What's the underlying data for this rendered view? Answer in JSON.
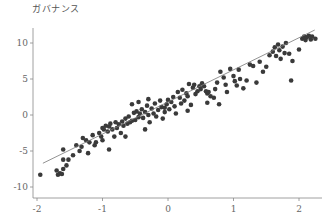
{
  "chart_data": {
    "type": "scatter",
    "title": "",
    "xlabel": "",
    "ylabel": "ガバナンス",
    "xlim": [
      -2.05,
      2.35
    ],
    "ylim": [
      -11,
      12.5
    ],
    "xticks": [
      -2,
      -1,
      0,
      1,
      2
    ],
    "yticks": [
      -10,
      -5,
      0,
      5,
      10
    ],
    "grid": false,
    "legend": null,
    "regression_line": {
      "x0": -1.91,
      "y0": -6.7,
      "x1": 2.24,
      "y1": 11.8
    },
    "points": [
      [
        -1.95,
        -8.3
      ],
      [
        -1.7,
        -7.7
      ],
      [
        -1.68,
        -8.3
      ],
      [
        -1.65,
        -8.1
      ],
      [
        -1.62,
        -8.2
      ],
      [
        -1.6,
        -7.5
      ],
      [
        -1.55,
        -7.0
      ],
      [
        -1.52,
        -6.2
      ],
      [
        -1.6,
        -4.8
      ],
      [
        -1.6,
        -6.2
      ],
      [
        -1.45,
        -5.6
      ],
      [
        -1.4,
        -4.2
      ],
      [
        -1.35,
        -5.0
      ],
      [
        -1.32,
        -4.4
      ],
      [
        -1.25,
        -3.5
      ],
      [
        -1.22,
        -5.3
      ],
      [
        -1.2,
        -3.8
      ],
      [
        -1.15,
        -2.8
      ],
      [
        -1.12,
        -4.2
      ],
      [
        -1.1,
        -3.8
      ],
      [
        -1.05,
        -2.5
      ],
      [
        -1.0,
        -1.8
      ],
      [
        -0.98,
        -2.0
      ],
      [
        -0.95,
        -1.5
      ],
      [
        -0.92,
        -2.3
      ],
      [
        -0.9,
        -1.6
      ],
      [
        -0.88,
        -1.2
      ],
      [
        -0.85,
        -2.0
      ],
      [
        -0.82,
        -3.0
      ],
      [
        -0.8,
        -1.0
      ],
      [
        -0.78,
        -1.8
      ],
      [
        -0.75,
        -1.3
      ],
      [
        -0.72,
        -2.5
      ],
      [
        -0.7,
        -0.9
      ],
      [
        -0.68,
        -1.5
      ],
      [
        -0.65,
        -0.5
      ],
      [
        -0.62,
        -1.2
      ],
      [
        -0.6,
        -0.2
      ],
      [
        -0.58,
        -1.0
      ],
      [
        -0.55,
        -0.8
      ],
      [
        -0.52,
        0.3
      ],
      [
        -0.5,
        -0.7
      ],
      [
        -0.48,
        0.5
      ],
      [
        -0.45,
        -0.3
      ],
      [
        -0.43,
        0.2
      ],
      [
        -0.4,
        0.8
      ],
      [
        -0.38,
        -0.4
      ],
      [
        -0.35,
        0.4
      ],
      [
        -0.32,
        1.3
      ],
      [
        -0.3,
        0.0
      ],
      [
        -0.28,
        -1.0
      ],
      [
        -0.25,
        0.9
      ],
      [
        -0.22,
        0.2
      ],
      [
        -0.2,
        1.6
      ],
      [
        -0.18,
        -0.2
      ],
      [
        -0.15,
        0.7
      ],
      [
        -0.12,
        2.0
      ],
      [
        -0.1,
        1.1
      ],
      [
        -0.08,
        -0.5
      ],
      [
        -0.05,
        0.4
      ],
      [
        -0.02,
        1.5
      ],
      [
        0.0,
        2.1
      ],
      [
        0.02,
        0.8
      ],
      [
        0.05,
        1.8
      ],
      [
        0.08,
        2.5
      ],
      [
        0.1,
        1.2
      ],
      [
        0.12,
        0.2
      ],
      [
        0.15,
        3.2
      ],
      [
        0.18,
        2.4
      ],
      [
        0.2,
        1.6
      ],
      [
        0.22,
        3.5
      ],
      [
        0.25,
        2.0
      ],
      [
        0.28,
        3.0
      ],
      [
        0.3,
        2.6
      ],
      [
        0.32,
        4.3
      ],
      [
        0.35,
        1.4
      ],
      [
        0.38,
        3.8
      ],
      [
        0.4,
        4.2
      ],
      [
        0.42,
        2.9
      ],
      [
        0.45,
        3.3
      ],
      [
        0.48,
        4.0
      ],
      [
        0.5,
        3.6
      ],
      [
        0.52,
        4.4
      ],
      [
        0.55,
        4.0
      ],
      [
        0.58,
        3.3
      ],
      [
        0.6,
        3.0
      ],
      [
        0.62,
        3.2
      ],
      [
        0.65,
        2.6
      ],
      [
        0.7,
        2.4
      ],
      [
        0.72,
        3.6
      ],
      [
        0.75,
        4.5
      ],
      [
        0.78,
        1.5
      ],
      [
        0.8,
        6.0
      ],
      [
        0.85,
        5.2
      ],
      [
        0.88,
        4.2
      ],
      [
        0.9,
        3.2
      ],
      [
        0.95,
        6.4
      ],
      [
        1.0,
        5.4
      ],
      [
        1.02,
        4.7
      ],
      [
        1.05,
        4.1
      ],
      [
        1.08,
        6.3
      ],
      [
        1.1,
        5.0
      ],
      [
        1.15,
        3.7
      ],
      [
        1.2,
        4.8
      ],
      [
        1.25,
        7.0
      ],
      [
        1.3,
        6.8
      ],
      [
        1.35,
        4.5
      ],
      [
        1.4,
        7.4
      ],
      [
        1.45,
        6.0
      ],
      [
        1.5,
        6.7
      ],
      [
        1.55,
        8.3
      ],
      [
        1.6,
        8.8
      ],
      [
        1.63,
        9.4
      ],
      [
        1.65,
        8.2
      ],
      [
        1.68,
        9.8
      ],
      [
        1.7,
        9.0
      ],
      [
        1.72,
        7.8
      ],
      [
        1.75,
        9.5
      ],
      [
        1.78,
        8.6
      ],
      [
        1.8,
        10.0
      ],
      [
        1.85,
        8.5
      ],
      [
        1.88,
        4.8
      ],
      [
        1.9,
        7.5
      ],
      [
        2.0,
        9.1
      ],
      [
        2.05,
        10.6
      ],
      [
        2.08,
        10.9
      ],
      [
        2.1,
        10.4
      ],
      [
        2.12,
        10.8
      ],
      [
        2.15,
        11.0
      ],
      [
        2.18,
        10.5
      ],
      [
        2.2,
        10.9
      ],
      [
        2.25,
        10.6
      ],
      [
        -1.3,
        -3.2
      ],
      [
        -1.0,
        -3.5
      ],
      [
        -0.9,
        -4.8
      ],
      [
        -1.02,
        -3.0
      ],
      [
        -0.55,
        1.5
      ],
      [
        -0.45,
        1.8
      ],
      [
        -0.3,
        2.2
      ],
      [
        -0.05,
        1.0
      ],
      [
        0.3,
        0.6
      ],
      [
        0.6,
        1.7
      ],
      [
        -0.65,
        -3.0
      ],
      [
        -0.35,
        -2.0
      ]
    ]
  }
}
